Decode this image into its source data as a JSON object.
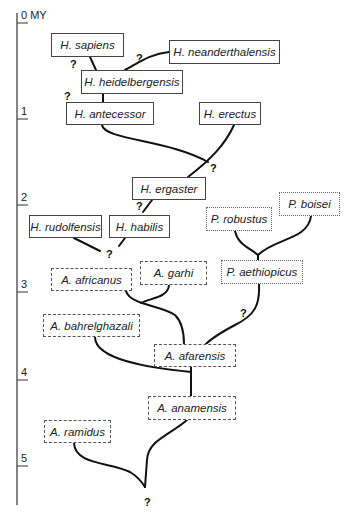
{
  "axis": {
    "unit": "MY",
    "ticks": [
      {
        "label": "0",
        "y": 23
      },
      {
        "label": "1",
        "y": 119
      },
      {
        "label": "2",
        "y": 205
      },
      {
        "label": "3",
        "y": 292
      },
      {
        "label": "4",
        "y": 380
      },
      {
        "label": "5",
        "y": 466
      }
    ]
  },
  "species": [
    {
      "id": "sapiens",
      "label": "H. sapiens",
      "style": "solid",
      "x": 51,
      "y": 33,
      "w": 73,
      "h": 24
    },
    {
      "id": "neanderthalensis",
      "label": "H. neanderthalensis",
      "style": "solid",
      "x": 169,
      "y": 40,
      "w": 111,
      "h": 24
    },
    {
      "id": "heidelbergensis",
      "label": "H. heidelbergensis",
      "style": "solid",
      "x": 81,
      "y": 70,
      "w": 102,
      "h": 24
    },
    {
      "id": "antecessor",
      "label": "H. antecessor",
      "style": "solid",
      "x": 66,
      "y": 102,
      "w": 88,
      "h": 23
    },
    {
      "id": "erectus",
      "label": "H. erectus",
      "style": "solid",
      "x": 199,
      "y": 102,
      "w": 62,
      "h": 23
    },
    {
      "id": "ergaster",
      "label": "H. ergaster",
      "style": "solid",
      "x": 132,
      "y": 177,
      "w": 74,
      "h": 23
    },
    {
      "id": "rudolfensis",
      "label": "H. rudolfensis",
      "style": "solid",
      "x": 29,
      "y": 215,
      "w": 73,
      "h": 23
    },
    {
      "id": "habilis",
      "label": "H. habilis",
      "style": "solid",
      "x": 109,
      "y": 215,
      "w": 61,
      "h": 23
    },
    {
      "id": "robustus",
      "label": "P. robustus",
      "style": "dotted",
      "x": 206,
      "y": 207,
      "w": 66,
      "h": 24
    },
    {
      "id": "boisei",
      "label": "P. boisei",
      "style": "dotted",
      "x": 279,
      "y": 192,
      "w": 61,
      "h": 24
    },
    {
      "id": "aethiopicus",
      "label": "P. aethiopicus",
      "style": "dotted",
      "x": 221,
      "y": 260,
      "w": 82,
      "h": 24
    },
    {
      "id": "africanus",
      "label": "A. africanus",
      "style": "dashed",
      "x": 51,
      "y": 268,
      "w": 81,
      "h": 23
    },
    {
      "id": "garhi",
      "label": "A. garhi",
      "style": "dashed",
      "x": 140,
      "y": 261,
      "w": 67,
      "h": 24
    },
    {
      "id": "bahrelghazali",
      "label": "A. bahrelghazali",
      "style": "dashed",
      "x": 43,
      "y": 314,
      "w": 97,
      "h": 23
    },
    {
      "id": "afarensis",
      "label": "A. afarensis",
      "style": "dashed",
      "x": 154,
      "y": 344,
      "w": 82,
      "h": 23
    },
    {
      "id": "anamensis",
      "label": "A. anamensis",
      "style": "dashed",
      "x": 148,
      "y": 396,
      "w": 88,
      "h": 24
    },
    {
      "id": "ramidus",
      "label": "A. ramidus",
      "style": "dashdot",
      "x": 44,
      "y": 420,
      "w": 67,
      "h": 23
    }
  ],
  "uncertain_markers": [
    {
      "label": "?",
      "x": 70,
      "y": 58
    },
    {
      "label": "?",
      "x": 136,
      "y": 52
    },
    {
      "label": "?",
      "x": 64,
      "y": 90
    },
    {
      "label": "?",
      "x": 210,
      "y": 162
    },
    {
      "label": "?",
      "x": 136,
      "y": 200
    },
    {
      "label": "?",
      "x": 106,
      "y": 248
    },
    {
      "label": "?",
      "x": 240,
      "y": 307
    },
    {
      "label": "?",
      "x": 144,
      "y": 496
    }
  ],
  "colors": {
    "line": "#111111",
    "axis": "#333333"
  }
}
